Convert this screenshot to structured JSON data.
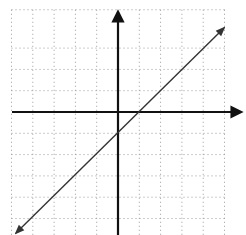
{
  "chart_data": {
    "type": "line",
    "title": "",
    "xlabel": "",
    "ylabel": "",
    "xlim": [
      -5,
      5
    ],
    "ylim": [
      -5,
      4
    ],
    "grid": true,
    "grid_style": "dotted",
    "axes_arrows": true,
    "series": [
      {
        "name": "line",
        "equation": "y = x - 1",
        "slope": 1,
        "intercept": -1,
        "x": [
          -4.9,
          5.0
        ],
        "y": [
          -5.9,
          4.0
        ],
        "arrows_both_ends": true
      }
    ]
  },
  "colors": {
    "background": "#ffffff",
    "grid": "#9a9a9a",
    "axes": "#111111",
    "line": "#333333"
  }
}
